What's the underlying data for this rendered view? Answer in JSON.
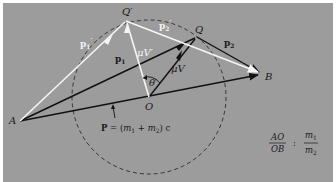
{
  "diagram": {
    "background_color": "#9c9c9c",
    "black_line_color": "#111111",
    "white_line_color": "#f5f5f5",
    "points": {
      "A": {
        "label": "A",
        "x": 20,
        "y": 121
      },
      "B": {
        "label": "B",
        "x": 262,
        "y": 74
      },
      "O": {
        "label": "O",
        "x": 149,
        "y": 97
      },
      "Q": {
        "label": "Q",
        "x": 197,
        "y": 37
      },
      "Q_prime": {
        "label": "Q′",
        "x": 126,
        "y": 21
      }
    },
    "circle": {
      "center": "O",
      "radius": 77,
      "style": "dashed"
    },
    "vectors": {
      "p1": {
        "label_main": "p",
        "label_sub": "1",
        "from": "A",
        "to": "Q",
        "color": "black"
      },
      "p2": {
        "label_main": "p",
        "label_sub": "2",
        "from": "Q",
        "to": "B",
        "color": "black"
      },
      "P": {
        "from": "A",
        "to": "B",
        "color": "black"
      },
      "muV": {
        "label": "μV",
        "from": "O",
        "to": "Q",
        "color": "black"
      },
      "p1_prime": {
        "label_main": "p",
        "label_sub": "1",
        "label_prime": "′",
        "from": "A",
        "to": "Q′",
        "color": "white"
      },
      "p2_prime": {
        "label_main": "p",
        "label_sub": "2",
        "label_prime": "′",
        "from": "Q′",
        "to": "B",
        "color": "white"
      },
      "muV_prime": {
        "label": "μV′",
        "from": "O",
        "to": "Q′",
        "color": "white"
      }
    },
    "angle": {
      "label": "θ′",
      "vertex": "O"
    },
    "momentum_equation": {
      "lhs": "P",
      "eq": " = (",
      "m1": "m",
      "m1_sub": "1",
      "plus": " + ",
      "m2": "m",
      "m2_sub": "2",
      "rhs": ") c"
    },
    "ratio_equation": {
      "numerator_left": "AO",
      "denominator_left": "OB",
      "separator": ":",
      "numerator_right": "m",
      "numerator_right_sub": "1",
      "denominator_right": "m",
      "denominator_right_sub": "2"
    }
  }
}
